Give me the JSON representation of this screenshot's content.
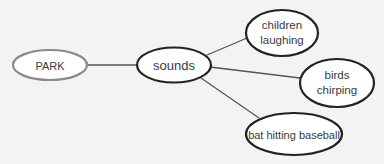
{
  "diagram": {
    "type": "concept-web",
    "colors": {
      "background": "#f3f3f3",
      "root_stroke": "#8a8a8a",
      "node_stroke": "#222222",
      "line": "#555555",
      "text": "#3a3a3a"
    },
    "nodes": [
      {
        "id": "park",
        "label": "PARK"
      },
      {
        "id": "sounds",
        "label": "sounds"
      },
      {
        "id": "children",
        "label_line1": "children",
        "label_line2": "laughing"
      },
      {
        "id": "birds",
        "label_line1": "birds",
        "label_line2": "chirping"
      },
      {
        "id": "bat",
        "label": "bat hitting baseball"
      }
    ],
    "edges": [
      {
        "from": "park",
        "to": "sounds"
      },
      {
        "from": "sounds",
        "to": "children"
      },
      {
        "from": "sounds",
        "to": "birds"
      },
      {
        "from": "sounds",
        "to": "bat"
      }
    ]
  }
}
